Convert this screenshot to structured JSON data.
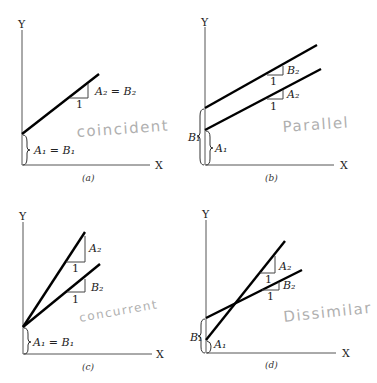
{
  "axis_labels": {
    "y": "Y",
    "x": "X"
  },
  "panels": {
    "a": {
      "caption": "(a)",
      "slope_run": "1",
      "slope_label": "A₂ = B₂",
      "intercept_label": "A₁ = B₁",
      "handwritten": "coincident"
    },
    "b": {
      "caption": "(b)",
      "slope_run_upper": "1",
      "slope_label_upper": "B₂",
      "slope_run_lower": "1",
      "slope_label_lower": "A₂",
      "intercept_outer": "B₁",
      "intercept_inner": "A₁",
      "handwritten": "Parallel"
    },
    "c": {
      "caption": "(c)",
      "slope_run_a": "1",
      "slope_label_a": "A₂",
      "slope_run_b": "1",
      "slope_label_b": "B₂",
      "intercept_label": "A₁ = B₁",
      "handwritten": "concurrent"
    },
    "d": {
      "caption": "(d)",
      "slope_run_a": "1",
      "slope_label_a": "A₂",
      "slope_run_b": "1",
      "slope_label_b": "B₂",
      "intercept_outer": "B₁",
      "intercept_inner": "A₁",
      "handwritten": "Dissimilar"
    }
  }
}
